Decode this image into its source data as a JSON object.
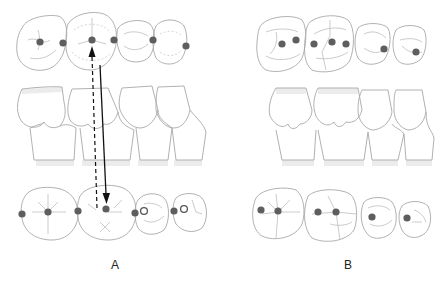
{
  "panels": [
    {
      "id": "A",
      "label": "A"
    },
    {
      "id": "B",
      "label": "B"
    }
  ],
  "colors": {
    "contact_dot": "#5e5e5e",
    "open_circle_stroke": "#555555",
    "outline": "#a8a8a8",
    "arrow": "#111111",
    "background": "#ffffff"
  },
  "legend": {
    "filled_dot": "occlusal contact point",
    "open_circle": "non-contact marker",
    "solid_arrow": "contact direction",
    "dashed_arrow": "opposing contact direction"
  }
}
